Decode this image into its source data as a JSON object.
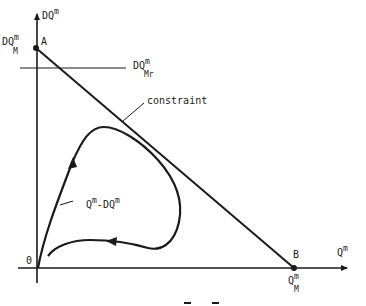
{
  "diagram": {
    "axes": {
      "y_label": {
        "base": "DQ",
        "sup": "m"
      },
      "x_label": {
        "base": "Q",
        "sup": "m"
      },
      "origin_label": "0"
    },
    "points": {
      "A": {
        "name": "A",
        "value": {
          "base": "DQ",
          "sup": "m",
          "sub": "M"
        }
      },
      "B": {
        "name": "B",
        "value": {
          "base": "Q",
          "sup": "m",
          "sub": "M"
        }
      }
    },
    "reference_line": {
      "base": "DQ",
      "sup": "m",
      "sub": "Mr"
    },
    "constraint_label": "constraint",
    "trajectory_label": {
      "a": "Q",
      "a_sup": "m",
      "sep": "-DQ",
      "b_sup": "m"
    },
    "colors": {
      "ink": "#1a1a1a",
      "background": "#ffffff"
    }
  }
}
